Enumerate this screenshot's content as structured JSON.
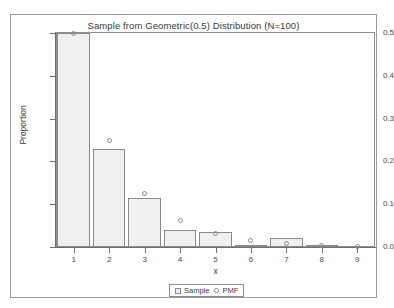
{
  "chart_data": {
    "type": "bar",
    "title": "Sample from Geometric(0.5) Distribution (N=100)",
    "xlabel": "x",
    "ylabel": "Proportion",
    "categories": [
      "1",
      "2",
      "3",
      "4",
      "5",
      "6",
      "7",
      "8",
      "9"
    ],
    "ylim": [
      0.0,
      0.5
    ],
    "xlim": [
      0.5,
      9.5
    ],
    "grid": false,
    "legend_position": "bottom-center",
    "y_ticks": [
      "0.0",
      "0.1",
      "0.2",
      "0.3",
      "0.4",
      "0.5"
    ],
    "y_tick_values": [
      0.0,
      0.1,
      0.2,
      0.3,
      0.4,
      0.5
    ],
    "series": [
      {
        "name": "Sample",
        "marker": "square",
        "values": [
          0.5,
          0.23,
          0.115,
          0.04,
          0.035,
          0.005,
          0.02,
          0.005,
          0.0
        ]
      },
      {
        "name": "PMF",
        "marker": "circle",
        "values": [
          0.5,
          0.25,
          0.125,
          0.0625,
          0.031,
          0.016,
          0.008,
          0.004,
          0.002
        ]
      }
    ]
  },
  "legend": {
    "sample_label": "Sample",
    "pmf_label": "PMF"
  },
  "colors": {
    "bar_fill": "#f0f0f0",
    "bar_border": "#8a8a8a",
    "axis": "#6f6f6f",
    "frame": "#9a9a9a",
    "text": "#3c3c3c"
  }
}
